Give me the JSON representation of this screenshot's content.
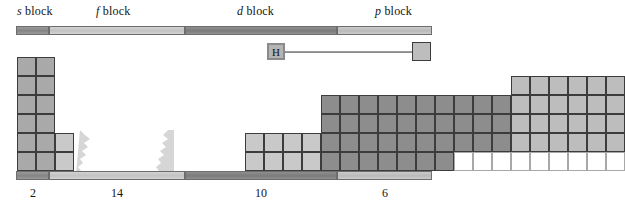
{
  "figure": {
    "background": "#ffffff"
  },
  "blocks": {
    "s": {
      "name": "s block",
      "symbol": "s",
      "word": "block",
      "count": "2",
      "bar_color": "#8a8a8a",
      "cell_color": "#a9a9a9",
      "bar": {
        "x": 16,
        "width": 33
      },
      "label": {
        "x": 17,
        "y": 4
      },
      "count_label": {
        "x": 33,
        "y": 186
      }
    },
    "f": {
      "name": "f block",
      "symbol": "f",
      "word": "block",
      "count": "14",
      "bar_color": "#c4c4c4",
      "cell_color": "#c9c9c9",
      "bar": {
        "x": 49,
        "width": 136
      },
      "label": {
        "x": 96,
        "y": 4
      },
      "count_label": {
        "x": 117,
        "y": 186
      }
    },
    "d": {
      "name": "d block",
      "symbol": "d",
      "word": "block",
      "count": "10",
      "bar_color": "#7f7f7f",
      "cell_color": "#8d8d8d",
      "bar": {
        "x": 185,
        "width": 152
      },
      "label": {
        "x": 237,
        "y": 4
      },
      "count_label": {
        "x": 261,
        "y": 186
      }
    },
    "p": {
      "name": "p block",
      "symbol": "p",
      "word": "block",
      "count": "6",
      "bar_color": "#bbbbbb",
      "cell_color": "#bdbdbd",
      "bar": {
        "x": 337,
        "width": 95
      },
      "label": {
        "x": 375,
        "y": 4
      },
      "count_label": {
        "x": 385,
        "y": 186
      }
    }
  },
  "bars": {
    "top_y": 26,
    "bottom_y": 171,
    "height": 9
  },
  "grid": {
    "origin_x": 17,
    "origin_y": 57,
    "cell_w": 19,
    "cell_h": 19,
    "rows": 6,
    "note": "Row index 0 is top (period 1) through 5 (period 6+)"
  },
  "cells": [
    {
      "block": "s",
      "col": 0,
      "row": 0
    },
    {
      "block": "s",
      "col": 1,
      "row": 0
    },
    {
      "block": "s",
      "col": 0,
      "row": 1
    },
    {
      "block": "s",
      "col": 1,
      "row": 1
    },
    {
      "block": "s",
      "col": 0,
      "row": 2
    },
    {
      "block": "s",
      "col": 1,
      "row": 2
    },
    {
      "block": "s",
      "col": 0,
      "row": 3
    },
    {
      "block": "s",
      "col": 1,
      "row": 3
    },
    {
      "block": "s",
      "col": 0,
      "row": 4
    },
    {
      "block": "s",
      "col": 1,
      "row": 4
    },
    {
      "block": "s",
      "col": 0,
      "row": 5
    },
    {
      "block": "s",
      "col": 1,
      "row": 5
    },
    {
      "block": "f",
      "col": 2,
      "row": 4
    },
    {
      "block": "f",
      "col": 3,
      "row": 4
    },
    {
      "block": "f",
      "col": 2,
      "row": 5
    },
    {
      "block": "f",
      "col": 3,
      "row": 5
    },
    {
      "block": "f",
      "col": 12,
      "row": 4
    },
    {
      "block": "f",
      "col": 13,
      "row": 4
    },
    {
      "block": "f",
      "col": 12,
      "row": 5
    },
    {
      "block": "f",
      "col": 13,
      "row": 5
    },
    {
      "block": "f",
      "col": 14,
      "row": 4
    },
    {
      "block": "f",
      "col": 15,
      "row": 4
    },
    {
      "block": "f",
      "col": 14,
      "row": 5
    },
    {
      "block": "f",
      "col": 15,
      "row": 5
    },
    {
      "block": "d",
      "col": 16,
      "row": 2
    },
    {
      "block": "d",
      "col": 17,
      "row": 2
    },
    {
      "block": "d",
      "col": 18,
      "row": 2
    },
    {
      "block": "d",
      "col": 19,
      "row": 2
    },
    {
      "block": "d",
      "col": 20,
      "row": 2
    },
    {
      "block": "d",
      "col": 21,
      "row": 2
    },
    {
      "block": "d",
      "col": 22,
      "row": 2
    },
    {
      "block": "d",
      "col": 23,
      "row": 2
    },
    {
      "block": "d",
      "col": 24,
      "row": 2
    },
    {
      "block": "d",
      "col": 25,
      "row": 2
    },
    {
      "block": "d",
      "col": 16,
      "row": 3
    },
    {
      "block": "d",
      "col": 17,
      "row": 3
    },
    {
      "block": "d",
      "col": 18,
      "row": 3
    },
    {
      "block": "d",
      "col": 19,
      "row": 3
    },
    {
      "block": "d",
      "col": 20,
      "row": 3
    },
    {
      "block": "d",
      "col": 21,
      "row": 3
    },
    {
      "block": "d",
      "col": 22,
      "row": 3
    },
    {
      "block": "d",
      "col": 23,
      "row": 3
    },
    {
      "block": "d",
      "col": 24,
      "row": 3
    },
    {
      "block": "d",
      "col": 25,
      "row": 3
    },
    {
      "block": "d",
      "col": 16,
      "row": 4
    },
    {
      "block": "d",
      "col": 17,
      "row": 4
    },
    {
      "block": "d",
      "col": 18,
      "row": 4
    },
    {
      "block": "d",
      "col": 19,
      "row": 4
    },
    {
      "block": "d",
      "col": 20,
      "row": 4
    },
    {
      "block": "d",
      "col": 21,
      "row": 4
    },
    {
      "block": "d",
      "col": 22,
      "row": 4
    },
    {
      "block": "d",
      "col": 23,
      "row": 4
    },
    {
      "block": "d",
      "col": 24,
      "row": 4
    },
    {
      "block": "d",
      "col": 25,
      "row": 4
    },
    {
      "block": "d",
      "col": 16,
      "row": 5
    },
    {
      "block": "d",
      "col": 17,
      "row": 5
    },
    {
      "block": "d",
      "col": 18,
      "row": 5
    },
    {
      "block": "d",
      "col": 19,
      "row": 5
    },
    {
      "block": "d",
      "col": 20,
      "row": 5
    },
    {
      "block": "d",
      "col": 21,
      "row": 5
    },
    {
      "block": "d",
      "col": 22,
      "row": 5
    },
    {
      "block": "empty",
      "col": 23,
      "row": 5
    },
    {
      "block": "empty",
      "col": 24,
      "row": 5
    },
    {
      "block": "empty",
      "col": 25,
      "row": 5
    },
    {
      "block": "p",
      "col": 26,
      "row": 1
    },
    {
      "block": "p",
      "col": 27,
      "row": 1
    },
    {
      "block": "p",
      "col": 28,
      "row": 1
    },
    {
      "block": "p",
      "col": 29,
      "row": 1
    },
    {
      "block": "p",
      "col": 30,
      "row": 1
    },
    {
      "block": "p",
      "col": 31,
      "row": 1
    },
    {
      "block": "p",
      "col": 26,
      "row": 2
    },
    {
      "block": "p",
      "col": 27,
      "row": 2
    },
    {
      "block": "p",
      "col": 28,
      "row": 2
    },
    {
      "block": "p",
      "col": 29,
      "row": 2
    },
    {
      "block": "p",
      "col": 30,
      "row": 2
    },
    {
      "block": "p",
      "col": 31,
      "row": 2
    },
    {
      "block": "p",
      "col": 26,
      "row": 3
    },
    {
      "block": "p",
      "col": 27,
      "row": 3
    },
    {
      "block": "p",
      "col": 28,
      "row": 3
    },
    {
      "block": "p",
      "col": 29,
      "row": 3
    },
    {
      "block": "p",
      "col": 30,
      "row": 3
    },
    {
      "block": "p",
      "col": 31,
      "row": 3
    },
    {
      "block": "p",
      "col": 26,
      "row": 4
    },
    {
      "block": "p",
      "col": 27,
      "row": 4
    },
    {
      "block": "p",
      "col": 28,
      "row": 4
    },
    {
      "block": "p",
      "col": 29,
      "row": 4
    },
    {
      "block": "p",
      "col": 30,
      "row": 4
    },
    {
      "block": "p",
      "col": 31,
      "row": 4
    },
    {
      "block": "empty",
      "col": 26,
      "row": 5
    },
    {
      "block": "empty",
      "col": 27,
      "row": 5
    },
    {
      "block": "empty",
      "col": 28,
      "row": 5
    },
    {
      "block": "empty",
      "col": 29,
      "row": 5
    },
    {
      "block": "empty",
      "col": 30,
      "row": 5
    },
    {
      "block": "empty",
      "col": 31,
      "row": 5
    }
  ],
  "callout": {
    "hydrogen": {
      "symbol": "H",
      "box": {
        "x": 267,
        "y": 43,
        "w": 18,
        "h": 17
      },
      "color": "#b4b4b4"
    },
    "helium": {
      "symbol": "",
      "box": {
        "x": 412,
        "y": 42,
        "w": 19,
        "h": 19
      },
      "color": "#bdbdbd"
    },
    "connector": {
      "x": 285,
      "y": 51,
      "w": 127
    }
  }
}
